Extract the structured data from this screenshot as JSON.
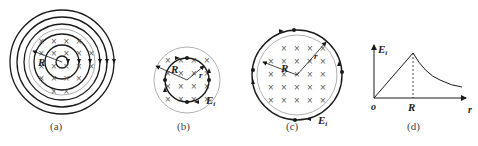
{
  "figures": [
    {
      "id": "a",
      "caption": "(a)",
      "labels": {
        "radius": "R"
      },
      "description": "Concentric induced electric field lines inside and outside a cylindrical magnetic field region (field into page)"
    },
    {
      "id": "b",
      "caption": "(b)",
      "labels": {
        "radius_big": "R",
        "radius_small": "r",
        "field": "E",
        "field_sub": "i"
      },
      "description": "Circular path of radius r inside magnetic field region of radius R"
    },
    {
      "id": "c",
      "caption": "(c)",
      "labels": {
        "radius_big": "R",
        "radius_small": "r",
        "field": "E",
        "field_sub": "i"
      },
      "description": "Circular path of radius r outside magnetic field region of radius R"
    },
    {
      "id": "d",
      "caption": "(d)",
      "labels": {
        "y_axis": "E",
        "y_axis_sub": "i",
        "x_axis": "r",
        "origin": "o",
        "x_mark": "R"
      },
      "description": "Induced field E_i vs r: linear rise to R, then 1/r decay"
    }
  ],
  "field_symbol": "×",
  "colors": {
    "line": "#1a1a1a",
    "boundary": "#9a9a9a",
    "text": "#222222"
  }
}
